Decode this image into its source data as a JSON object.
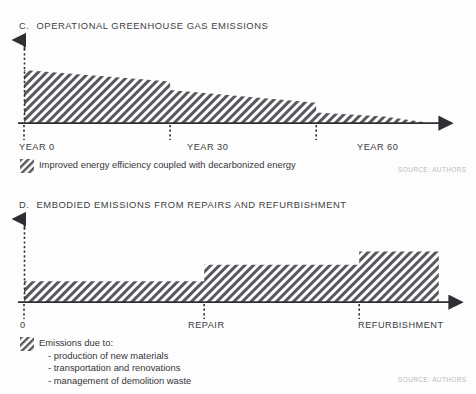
{
  "page": {
    "background_color": "#fdfdfd",
    "width": 476,
    "height": 394
  },
  "panels": [
    {
      "key": "operational",
      "letter": "C.",
      "title": "OPERATIONAL GREENHOUSE GAS EMISSIONS",
      "axis_labels": [
        "YEAR 0",
        "YEAR 30",
        "YEAR 60"
      ],
      "legend_text": "Improved energy efficiency coupled with decarbonized energy",
      "source": "SOURCE: AUTHORS"
    },
    {
      "key": "embodied",
      "letter": "D.",
      "title": "EMBODIED EMISSIONS FROM REPAIRS AND REFURBISHMENT",
      "axis_labels": [
        "0",
        "REPAIR",
        "REFURBISHMENT"
      ],
      "legend_title": "Emissions due to:",
      "legend_items": [
        "- production of new materials",
        "- transportation and renovations",
        "- management of demolition waste"
      ],
      "source": "SOURCE: AUTHORS"
    }
  ],
  "colors": {
    "hatch_dark": "#58585e",
    "hatch_light": "#ffffff",
    "axis": "#2f2f33",
    "text": "#3b3b40",
    "source": "#b9b9bd"
  },
  "chart_data": [
    {
      "type": "area",
      "id": "operational-emissions",
      "title": "C. OPERATIONAL GREENHOUSE GAS EMISSIONS",
      "xlabel": "",
      "ylabel": "",
      "grid": false,
      "legend_position": "below",
      "legend": [
        "Improved energy efficiency coupled with decarbonized energy"
      ],
      "x_ticks": [
        0,
        30,
        60
      ],
      "x_tick_labels": [
        "YEAR 0",
        "YEAR 30",
        "YEAR 60"
      ],
      "xlim": [
        0,
        85
      ],
      "ylim": [
        0,
        1.15
      ],
      "annotations": [
        "SOURCE: AUTHORS"
      ],
      "series": [
        {
          "name": "Operational emissions",
          "comment": "Stepped-declining area: gradual decay with abrupt drops at year 30 and year 60, tapering to zero near year 82",
          "points": [
            {
              "x": 0,
              "y": 1.0
            },
            {
              "x": 30,
              "y": 0.78
            },
            {
              "x": 30,
              "y": 0.62
            },
            {
              "x": 60,
              "y": 0.38
            },
            {
              "x": 60,
              "y": 0.2
            },
            {
              "x": 74,
              "y": 0.12
            },
            {
              "x": 82,
              "y": 0.02
            }
          ]
        }
      ]
    },
    {
      "type": "bar",
      "id": "embodied-emissions",
      "title": "D. EMBODIED EMISSIONS FROM REPAIRS AND REFURBISHMENT",
      "xlabel": "",
      "ylabel": "",
      "grid": false,
      "legend_position": "below",
      "legend": [
        "Emissions due to: production of new materials; transportation and renovations; management of demolition waste"
      ],
      "categories": [
        "0",
        "REPAIR",
        "REFURBISHMENT"
      ],
      "values": [
        0.3,
        0.54,
        0.73
      ],
      "xlim": [
        0,
        100
      ],
      "ylim": [
        0,
        1.0
      ],
      "annotations": [
        "SOURCE: AUTHORS"
      ],
      "step_starts": [
        0,
        43,
        80
      ],
      "step_ends": [
        43,
        80,
        99
      ]
    }
  ]
}
